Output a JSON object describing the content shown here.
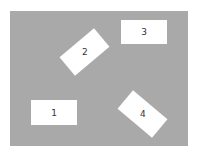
{
  "diagram": {
    "background_color": "#a9a9a9",
    "box_color": "#ffffff",
    "boxes": [
      {
        "label": "1",
        "rotation_deg": 0
      },
      {
        "label": "2",
        "rotation_deg": -40
      },
      {
        "label": "3",
        "rotation_deg": 0
      },
      {
        "label": "4",
        "rotation_deg": 40
      }
    ]
  }
}
